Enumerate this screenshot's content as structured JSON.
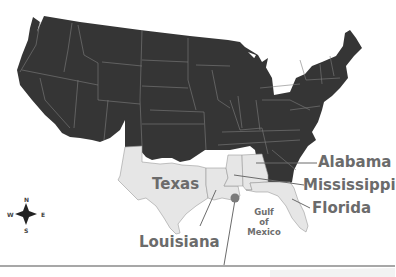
{
  "map": {
    "title": "",
    "colors": {
      "us_states": "#353535",
      "highlighted_states": "#e6e6e6",
      "state_borders": "#8a8a8a",
      "labels": "#6b6b6b",
      "marker": "#7a7a7a",
      "baseline": "#7a7a7a"
    },
    "labels": {
      "texas": "Texas",
      "louisiana": "Louisiana",
      "alabama": "Alabama",
      "mississippi": "Mississippi",
      "florida": "Florida",
      "gulf_line1": "Gulf",
      "gulf_line2": "of",
      "gulf_line3": "Mexico"
    },
    "highlighted_states": [
      "Texas",
      "Louisiana",
      "Mississippi",
      "Alabama",
      "Florida"
    ],
    "compass": {
      "n": "N",
      "s": "S",
      "e": "E",
      "w": "W",
      "icon": "compass-rose-icon"
    },
    "marker": {
      "icon": "location-pin-icon",
      "x": 234,
      "y": 198
    }
  }
}
